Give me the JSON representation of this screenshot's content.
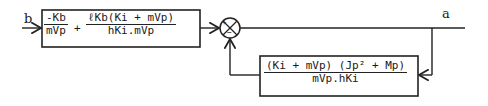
{
  "diagram": {
    "input_label": "b",
    "output_label": "a",
    "forward_block": {
      "term1": {
        "numerator": "-Kb",
        "denominator": "mVp"
      },
      "operator": "+",
      "term2": {
        "numerator": "ℓKb(Ki + mVp)",
        "denominator": "hKi.mVp"
      }
    },
    "summing_junction": {
      "input_sign": "+",
      "feedback_sign": "−"
    },
    "feedback_block": {
      "numerator": "(Ki + mVp) (Jp² + Mp)",
      "denominator": "mVp.hKi"
    },
    "colors": {
      "line": "#222222",
      "background": "#ffffff"
    }
  }
}
